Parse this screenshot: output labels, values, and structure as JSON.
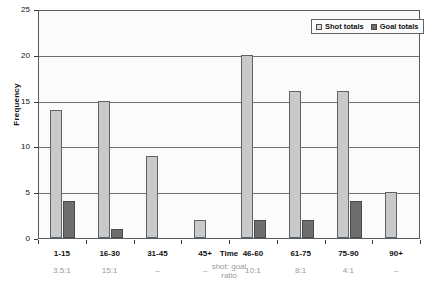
{
  "chart_data": {
    "type": "bar",
    "title": "",
    "xlabel": "Time",
    "ylabel": "Frequency",
    "ylim": [
      0,
      25
    ],
    "yticks": [
      0,
      5,
      10,
      15,
      20,
      25
    ],
    "grid": true,
    "legend_position": "top-right",
    "categories": [
      "1-15",
      "16-30",
      "31-45",
      "45+",
      "46-60",
      "61-75",
      "75-90",
      "90+"
    ],
    "series": [
      {
        "name": "Shot totals",
        "values": [
          14,
          15,
          9,
          2,
          20,
          16,
          16,
          5
        ]
      },
      {
        "name": "Goal totals",
        "values": [
          4,
          1,
          0,
          0,
          2,
          2,
          4,
          0
        ]
      }
    ],
    "annotations": {
      "ratio_row_label": "shot: goal\nratio",
      "ratio_row_label_line1": "shot: goal",
      "ratio_row_label_line2": "ratio",
      "ratios": [
        "3.5:1",
        "15:1",
        "–",
        "–",
        "10:1",
        "8:1",
        "4:1",
        "–"
      ]
    }
  },
  "axes": {
    "y_title": "Frequency",
    "x_title": "Time",
    "y_tick_labels": [
      "0",
      "5",
      "10",
      "15",
      "20",
      "25"
    ]
  },
  "legend": {
    "items": [
      {
        "label": "Shot totals",
        "color": "#dcdcdc",
        "swatch": "shot-swatch-icon"
      },
      {
        "label": "Goal totals",
        "color": "#6e6e6e",
        "swatch": "goal-swatch-icon"
      }
    ]
  },
  "colors": {
    "shot_bar": "#c9c9c9",
    "goal_bar": "#6e6e6e",
    "bar_border": "#5e636a",
    "gridline": "#6a7078",
    "plot_background": "#fbfbfb",
    "ratio_text": "#9a9a9a",
    "axis_text": "#111111"
  }
}
